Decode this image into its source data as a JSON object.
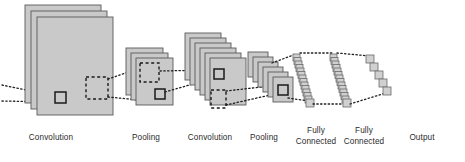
{
  "figure": {
    "background_color": "#ffffff",
    "width": 465,
    "height": 162
  },
  "style": {
    "plane_fill": "#c9c9c9",
    "plane_stroke": "#5a5a5a",
    "cube_fill": "#d0d0d0",
    "cube_stroke": "#6a6a6a",
    "dotted_line_color": "#1f1f1f",
    "dashed_box_color": "#1f1f1f",
    "label_color": "#2b2b2b"
  },
  "labels": {
    "convolution_1": "Convolution",
    "pooling_1": "Pooling",
    "convolution_2": "Convolution",
    "pooling_2": "Pooling",
    "fully_connected_1": "Fully\nConnected",
    "fully_connected_2": "Fully\nConnected",
    "output": "Output"
  },
  "layers": [
    {
      "id": "convolution-1",
      "name": "Convolution",
      "kind": "feature-map-stack",
      "plane_count": 3,
      "plane_width": 76,
      "plane_height": 98,
      "offset_x": 6,
      "offset_y": 6,
      "origin_x": 25,
      "origin_y": 5,
      "receptive_field_box": {
        "x": 55,
        "y": 92,
        "w": 11,
        "h": 11,
        "style": "solid"
      },
      "dashed_region": {
        "x": 86,
        "y": 77,
        "w": 22,
        "h": 22,
        "style": "dashed"
      }
    },
    {
      "id": "pooling-1",
      "name": "Pooling",
      "kind": "feature-map-stack",
      "plane_count": 3,
      "plane_width": 37,
      "plane_height": 47,
      "offset_x": 5,
      "offset_y": 5,
      "origin_x": 126,
      "origin_y": 48,
      "receptive_field_box": {
        "x": 153,
        "y": 92,
        "w": 10,
        "h": 10,
        "style": "solid"
      },
      "dashed_region": {
        "x": 136,
        "y": 66,
        "w": 20,
        "h": 20,
        "style": "dashed"
      }
    },
    {
      "id": "convolution-2",
      "name": "Convolution",
      "kind": "feature-map-stack",
      "plane_count": 6,
      "plane_width": 36,
      "plane_height": 47,
      "offset_x": 5,
      "offset_y": 5,
      "origin_x": 185,
      "origin_y": 33,
      "receptive_field_box": {
        "x": 212,
        "y": 70,
        "w": 9,
        "h": 9,
        "style": "solid"
      },
      "dashed_region": {
        "x": 205,
        "y": 92,
        "w": 16,
        "h": 19,
        "style": "dashed"
      }
    },
    {
      "id": "pooling-2",
      "name": "Pooling",
      "kind": "feature-map-stack",
      "plane_count": 6,
      "plane_width": 20,
      "plane_height": 25,
      "offset_x": 4.5,
      "offset_y": 4.5,
      "origin_x": 248,
      "origin_y": 52,
      "receptive_field_box": {
        "x": 278,
        "y": 86,
        "w": 10,
        "h": 10,
        "style": "solid"
      }
    },
    {
      "id": "fully-connected-1",
      "name": "Fully Connected",
      "kind": "neuron-column",
      "cube_count": 14,
      "cube_size": 7,
      "top_x": 293,
      "top_y": 54,
      "bottom_x": 306,
      "bottom_y": 99
    },
    {
      "id": "fully-connected-2",
      "name": "Fully Connected",
      "kind": "neuron-column",
      "cube_count": 14,
      "cube_size": 7,
      "top_x": 330,
      "top_y": 54,
      "bottom_x": 343,
      "bottom_y": 99
    },
    {
      "id": "output",
      "name": "Output",
      "kind": "neuron-column",
      "cube_count": 5,
      "cube_size": 7,
      "top_x": 366,
      "top_y": 55,
      "bottom_x": 384,
      "bottom_y": 91
    }
  ],
  "connections": [
    {
      "from": "input-edge",
      "to": "convolution-1.receptive_field",
      "style": "dotted"
    },
    {
      "from": "convolution-1.dashed_region",
      "to": "pooling-1.dashed_region",
      "style": "dotted"
    },
    {
      "from": "pooling-1.receptive_field",
      "to": "convolution-2.receptive_field",
      "style": "dotted"
    },
    {
      "from": "convolution-2.dashed_region",
      "to": "pooling-2.receptive_field",
      "style": "dotted"
    },
    {
      "from": "pooling-2.receptive_field",
      "to": "fully-connected-1",
      "style": "dotted"
    },
    {
      "from": "fully-connected-1",
      "to": "fully-connected-2",
      "style": "dotted"
    },
    {
      "from": "fully-connected-2",
      "to": "output",
      "style": "dotted"
    }
  ],
  "label_positions": {
    "convolution_1": {
      "x": 8,
      "y": 133,
      "w": 86
    },
    "pooling_1": {
      "x": 110,
      "y": 133,
      "w": 72
    },
    "convolution_2": {
      "x": 160,
      "y": 133,
      "w": 100
    },
    "pooling_2": {
      "x": 228,
      "y": 133,
      "w": 72
    },
    "fully_connected_1": {
      "x": 282,
      "y": 128,
      "w": 68
    },
    "fully_connected_2": {
      "x": 330,
      "y": 128,
      "w": 68
    },
    "output": {
      "x": 392,
      "y": 133,
      "w": 60
    }
  }
}
